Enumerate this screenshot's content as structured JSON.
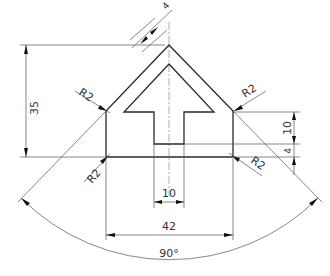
{
  "drawing": {
    "type": "technical-drawing",
    "subject": "arrow-shaped plate inside pointed pentagon outline",
    "dimensions": {
      "height_total": "35",
      "wall_thickness": "4",
      "stem_height": "10",
      "bottom_thickness": "4",
      "stem_width": "10",
      "overall_width": "42",
      "angle": "90°"
    },
    "radii": {
      "top_left": "R2",
      "top_right": "R2",
      "bottom_left": "R2",
      "bottom_right": "R2"
    }
  }
}
